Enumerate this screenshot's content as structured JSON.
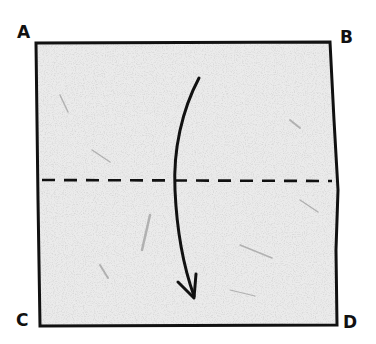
{
  "diagram": {
    "type": "origami-fold-step",
    "corners": {
      "top_left": "A",
      "top_right": "B",
      "bottom_left": "C",
      "bottom_right": "D"
    },
    "fold_line": {
      "style": "dashed",
      "kind": "valley-fold",
      "orientation": "horizontal",
      "position": "middle"
    },
    "arrow": {
      "direction": "down",
      "shape": "curved",
      "meaning": "fold top edge down to bottom edge"
    },
    "colors": {
      "paper": "#e6e6e6",
      "outline": "#111111",
      "background": "#ffffff"
    }
  }
}
